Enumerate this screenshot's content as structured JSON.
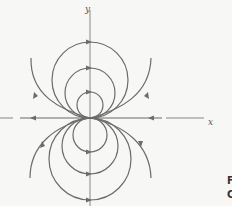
{
  "diagram": {
    "type": "phase-portrait",
    "axes": {
      "x_label": "x",
      "y_label": "y"
    },
    "stroke_color": "#6b6b6b",
    "origin": [
      90,
      118
    ],
    "upper_circles_radii": [
      13,
      25,
      38
    ],
    "lower_circles_radii": [
      17,
      28,
      41
    ],
    "upper_flow_direction": "clockwise-right-at-top",
    "lower_flow_direction": "right-at-bottom",
    "x_axis_flow": "toward-origin"
  },
  "caption_fragment": {
    "line1": "F",
    "line2": "C"
  }
}
